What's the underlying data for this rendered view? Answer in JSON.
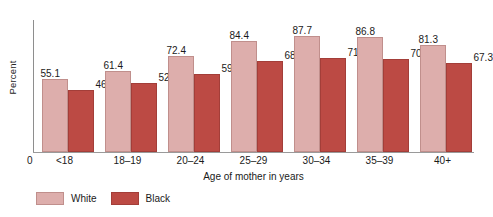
{
  "chart_data": {
    "type": "bar",
    "title": "",
    "xlabel": "Age of mother in years",
    "ylabel": "Percent",
    "origin_label": "0",
    "ylim": [
      0,
      100
    ],
    "grid": false,
    "legend_position": "bottom-left",
    "categories": [
      "<18",
      "18–19",
      "20–24",
      "25–29",
      "30–34",
      "35–39",
      "40+"
    ],
    "series": [
      {
        "name": "White",
        "color": "#ddaeac",
        "values": [
          55.1,
          61.4,
          72.4,
          84.4,
          87.7,
          86.8,
          81.3
        ],
        "labels": [
          "55.1",
          "61.4",
          "72.4",
          "84.4",
          "87.7",
          "86.8",
          "81.3"
        ]
      },
      {
        "name": "Black",
        "color": "#bc4a44",
        "values": [
          46.8,
          52.4,
          59.4,
          68.6,
          71.6,
          70.7,
          67.3
        ],
        "labels": [
          "46.8",
          "52.4",
          "59.4",
          "68.6",
          "71.6",
          "70.7",
          "67.3"
        ]
      }
    ]
  },
  "axis": {
    "y_title": "Percent",
    "x_title": "Age of mother in years",
    "origin": "0"
  },
  "legend": {
    "items": [
      {
        "label": "White",
        "color": "#ddaeac"
      },
      {
        "label": "Black",
        "color": "#bc4a44"
      }
    ]
  }
}
